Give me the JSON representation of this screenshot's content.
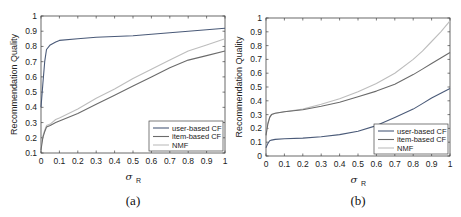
{
  "chart_data": [
    {
      "type": "line",
      "panel": "(a)",
      "title": "",
      "xlabel": "σ_R",
      "ylabel": "Recommendation Quality",
      "xlim": [
        0,
        1
      ],
      "ylim": [
        0.1,
        1
      ],
      "xticks": [
        "0",
        "0.1",
        "0.2",
        "0.3",
        "0.4",
        "0.5",
        "0.6",
        "0.7",
        "0.8",
        "0.9",
        "1"
      ],
      "yticks": [
        "0.1",
        "0.2",
        "0.3",
        "0.4",
        "0.5",
        "0.6",
        "0.7",
        "0.8",
        "0.9",
        "1"
      ],
      "legend_position": "lower right",
      "grid": false,
      "x": [
        0,
        0.01,
        0.02,
        0.03,
        0.05,
        0.08,
        0.1,
        0.2,
        0.3,
        0.4,
        0.5,
        0.6,
        0.7,
        0.8,
        0.9,
        1.0
      ],
      "series": [
        {
          "name": "user-based CF",
          "color": "#4a5a78",
          "values": [
            0.4,
            0.55,
            0.7,
            0.78,
            0.81,
            0.83,
            0.84,
            0.85,
            0.86,
            0.865,
            0.87,
            0.88,
            0.89,
            0.9,
            0.91,
            0.92
          ]
        },
        {
          "name": "item-based CF",
          "color": "#6b6b6b",
          "values": [
            0.12,
            0.2,
            0.24,
            0.27,
            0.28,
            0.3,
            0.31,
            0.36,
            0.42,
            0.48,
            0.54,
            0.6,
            0.66,
            0.71,
            0.74,
            0.77
          ]
        },
        {
          "name": "NMF",
          "color": "#bdbdbd",
          "values": [
            0.14,
            0.21,
            0.25,
            0.28,
            0.29,
            0.32,
            0.33,
            0.39,
            0.46,
            0.52,
            0.59,
            0.65,
            0.71,
            0.77,
            0.81,
            0.85
          ]
        }
      ],
      "caption": "(a)"
    },
    {
      "type": "line",
      "panel": "(b)",
      "title": "",
      "xlabel": "σ_R",
      "ylabel": "Recommendation Quality",
      "xlim": [
        0,
        1
      ],
      "ylim": [
        0,
        1
      ],
      "xticks": [
        "0",
        "0.1",
        "0.2",
        "0.3",
        "0.4",
        "0.5",
        "0.6",
        "0.7",
        "0.8",
        "0.9",
        "1"
      ],
      "yticks": [
        "0",
        "0.1",
        "0.2",
        "0.3",
        "0.4",
        "0.5",
        "0.6",
        "0.7",
        "0.8",
        "0.9",
        "1"
      ],
      "legend_position": "lower right",
      "grid": false,
      "x": [
        0,
        0.01,
        0.02,
        0.03,
        0.05,
        0.1,
        0.2,
        0.3,
        0.4,
        0.5,
        0.6,
        0.7,
        0.8,
        0.85,
        0.9,
        0.95,
        1.0
      ],
      "series": [
        {
          "name": "user-based CF",
          "color": "#4a5a78",
          "values": [
            0.06,
            0.09,
            0.11,
            0.115,
            0.12,
            0.125,
            0.13,
            0.14,
            0.155,
            0.18,
            0.22,
            0.28,
            0.34,
            0.38,
            0.42,
            0.455,
            0.49
          ]
        },
        {
          "name": "item-based CF",
          "color": "#6b6b6b",
          "values": [
            0.15,
            0.23,
            0.28,
            0.3,
            0.31,
            0.32,
            0.335,
            0.36,
            0.39,
            0.43,
            0.47,
            0.52,
            0.59,
            0.63,
            0.67,
            0.71,
            0.75
          ]
        },
        {
          "name": "NMF",
          "color": "#bdbdbd",
          "values": [
            0.17,
            0.24,
            0.28,
            0.3,
            0.31,
            0.32,
            0.34,
            0.375,
            0.415,
            0.465,
            0.525,
            0.6,
            0.7,
            0.76,
            0.83,
            0.9,
            0.98
          ]
        }
      ],
      "caption": "(b)"
    }
  ]
}
